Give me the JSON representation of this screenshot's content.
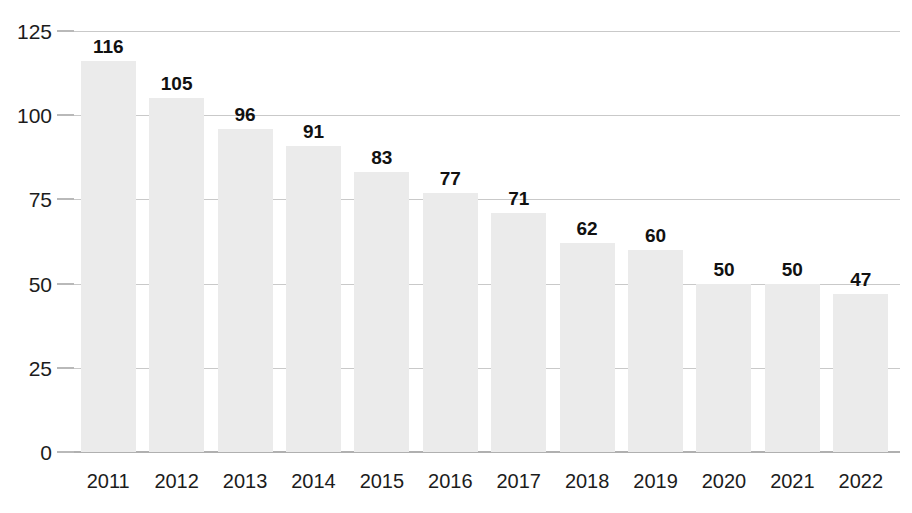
{
  "chart_data": {
    "type": "bar",
    "title": "",
    "subtitle": "",
    "xlabel": "",
    "ylabel": "",
    "categories": [
      "2011",
      "2012",
      "2013",
      "2014",
      "2015",
      "2016",
      "2017",
      "2018",
      "2019",
      "2020",
      "2021",
      "2022"
    ],
    "values": [
      116,
      105,
      96,
      91,
      83,
      77,
      71,
      62,
      60,
      50,
      50,
      47
    ],
    "data_labels": [
      "116",
      "105",
      "96",
      "91",
      "83",
      "77",
      "71",
      "62",
      "60",
      "50",
      "50",
      "47"
    ],
    "ylim": [
      0,
      125
    ],
    "ytick_values": [
      0,
      25,
      50,
      75,
      100,
      125
    ],
    "ytick_labels": [
      "0",
      "25",
      "50",
      "75",
      "100",
      "125"
    ],
    "grid": true,
    "grid_axis": "y",
    "legend": false,
    "legend_position": "none",
    "annotations": [],
    "colors": {
      "bar_fill": "#ebebeb",
      "gridline": "#c9c9c9",
      "axis_line": "#b0b0b0",
      "tick_mark": "#b9b9b9",
      "label_text": "#111111",
      "tick_text": "#1c1c1c",
      "background": "#ffffff"
    }
  }
}
